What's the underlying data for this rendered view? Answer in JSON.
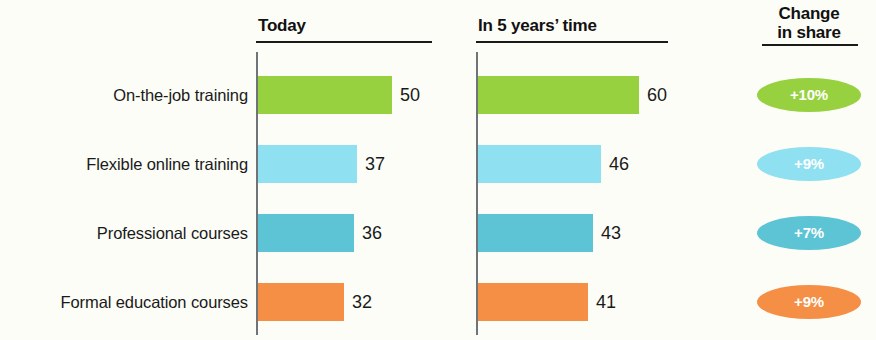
{
  "chart_data": {
    "type": "bar",
    "title": "",
    "orientation": "horizontal",
    "categories": [
      "On-the-job training",
      "Flexible online training",
      "Professional courses",
      "Formal education courses"
    ],
    "series": [
      {
        "name": "Today",
        "values": [
          50,
          37,
          36,
          32
        ]
      },
      {
        "name": "In 5 years’ time",
        "values": [
          60,
          46,
          43,
          41
        ]
      }
    ],
    "annotations": {
      "name": "Change in share",
      "values": [
        "+10%",
        "+9%",
        "+7%",
        "+9%"
      ]
    },
    "colors": [
      "#97d140",
      "#8fe0f0",
      "#5cc4d4",
      "#f58f45"
    ],
    "xlabel": "",
    "ylabel": "",
    "xlim": [
      0,
      70
    ],
    "grid": false,
    "legend": "none"
  },
  "headers": {
    "today": "Today",
    "future": "In 5 years’ time",
    "change_line1": "Change",
    "change_line2": "in share"
  },
  "rows": [
    {
      "label": "On-the-job training",
      "today_value": "50",
      "future_value": "60",
      "change": "+10%",
      "color": "#97d140"
    },
    {
      "label": "Flexible online training",
      "today_value": "37",
      "future_value": "46",
      "change": "+9%",
      "color": "#8fe0f0"
    },
    {
      "label": "Professional courses",
      "today_value": "36",
      "future_value": "43",
      "change": "+7%",
      "color": "#5cc4d4"
    },
    {
      "label": "Formal education courses",
      "today_value": "32",
      "future_value": "41",
      "change": "+9%",
      "color": "#f58f45"
    }
  ]
}
